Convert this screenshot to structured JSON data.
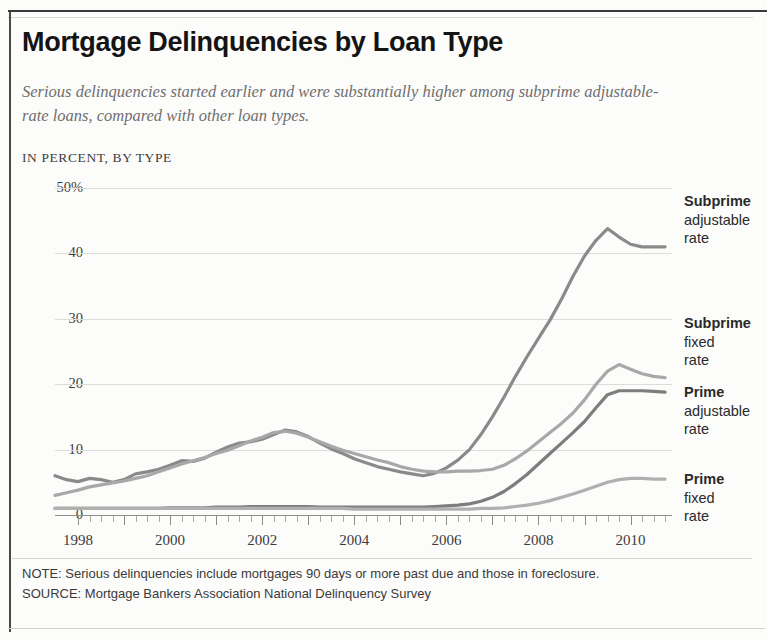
{
  "title": "Mortgage Delinquencies by Loan Type",
  "subtitle": "Serious delinquencies started earlier and were substantially higher among subprime adjustable-rate loans, compared with other loan types.",
  "kicker": "IN PERCENT, BY TYPE",
  "footer": {
    "note": "NOTE: Serious delinquencies include mortgages 90 days or more past due and those in foreclosure.",
    "source": "SOURCE: Mortgage Bankers Association National Delinquency Survey"
  },
  "legend": [
    {
      "name": "Subprime",
      "line2": "adjustable",
      "line3": "rate"
    },
    {
      "name": "Subprime",
      "line2": "fixed",
      "line3": "rate"
    },
    {
      "name": "Prime",
      "line2": "adjustable",
      "line3": "rate"
    },
    {
      "name": "Prime",
      "line2": "fixed",
      "line3": "rate"
    }
  ],
  "axis": {
    "y_ticks": [
      "50%",
      "40",
      "30",
      "20",
      "10",
      "0"
    ],
    "x_ticks": [
      "1998",
      "2000",
      "2002",
      "2004",
      "2006",
      "2008",
      "2010"
    ]
  },
  "colors": {
    "subprime_adjustable": "#8a8a8a",
    "subprime_fixed": "#a8a8a8",
    "prime_adjustable": "#7d7d7d",
    "prime_fixed": "#b0b0b0",
    "grid": "#dcdcda",
    "axis": "#8f8f8f"
  },
  "chart_data": {
    "type": "line",
    "title": "Mortgage Delinquencies by Loan Type",
    "subtitle": "Serious delinquencies started earlier and were substantially higher among subprime adjustable-rate loans, compared with other loan types.",
    "xlabel": "",
    "ylabel": "IN PERCENT, BY TYPE",
    "xlim": [
      1997.5,
      2010.9
    ],
    "ylim": [
      0,
      50
    ],
    "grid": true,
    "legend_position": "right",
    "x": [
      1997.5,
      1997.75,
      1998,
      1998.25,
      1998.5,
      1998.75,
      1999,
      1999.25,
      1999.5,
      1999.75,
      2000,
      2000.25,
      2000.5,
      2000.75,
      2001,
      2001.25,
      2001.5,
      2001.75,
      2002,
      2002.25,
      2002.5,
      2002.75,
      2003,
      2003.25,
      2003.5,
      2003.75,
      2004,
      2004.25,
      2004.5,
      2004.75,
      2005,
      2005.25,
      2005.5,
      2005.75,
      2006,
      2006.25,
      2006.5,
      2006.75,
      2007,
      2007.25,
      2007.5,
      2007.75,
      2008,
      2008.25,
      2008.5,
      2008.75,
      2009,
      2009.25,
      2009.5,
      2009.75,
      2010,
      2010.25,
      2010.5,
      2010.75
    ],
    "series": [
      {
        "name": "Subprime adjustable rate",
        "color": "#8a8a8a",
        "values": [
          6.0,
          5.4,
          5.1,
          5.6,
          5.4,
          5.0,
          5.4,
          6.3,
          6.6,
          7.0,
          7.6,
          8.3,
          8.2,
          8.7,
          9.6,
          10.4,
          11.0,
          11.2,
          11.6,
          12.3,
          13.0,
          12.7,
          12.0,
          11.0,
          10.1,
          9.4,
          8.6,
          8.0,
          7.4,
          7.0,
          6.6,
          6.3,
          6.0,
          6.4,
          7.2,
          8.4,
          10.0,
          12.3,
          15.0,
          18.0,
          21.2,
          24.2,
          27.0,
          29.8,
          33.0,
          36.5,
          39.6,
          42.0,
          43.8,
          42.5,
          41.4,
          41.0,
          41.0,
          41.0
        ]
      },
      {
        "name": "Subprime fixed rate",
        "color": "#a8a8a8",
        "values": [
          3.0,
          3.4,
          3.8,
          4.3,
          4.6,
          4.9,
          5.2,
          5.6,
          6.0,
          6.6,
          7.2,
          7.8,
          8.3,
          8.8,
          9.4,
          9.9,
          10.6,
          11.3,
          11.9,
          12.6,
          12.8,
          12.5,
          11.9,
          11.2,
          10.5,
          9.9,
          9.4,
          8.9,
          8.4,
          8.0,
          7.4,
          7.0,
          6.7,
          6.6,
          6.6,
          6.7,
          6.7,
          6.8,
          7.0,
          7.6,
          8.6,
          9.8,
          11.2,
          12.6,
          14.0,
          15.6,
          17.6,
          20.0,
          22.0,
          23.0,
          22.3,
          21.6,
          21.2,
          21.0
        ]
      },
      {
        "name": "Prime adjustable rate",
        "color": "#7d7d7d",
        "values": [
          1.0,
          1.0,
          1.0,
          1.0,
          1.0,
          1.0,
          1.0,
          1.0,
          1.0,
          1.0,
          1.1,
          1.1,
          1.1,
          1.1,
          1.2,
          1.2,
          1.2,
          1.3,
          1.3,
          1.3,
          1.3,
          1.3,
          1.3,
          1.2,
          1.2,
          1.2,
          1.2,
          1.2,
          1.2,
          1.2,
          1.2,
          1.2,
          1.2,
          1.3,
          1.4,
          1.5,
          1.7,
          2.1,
          2.7,
          3.6,
          4.8,
          6.2,
          7.8,
          9.4,
          11.0,
          12.6,
          14.3,
          16.4,
          18.4,
          19.0,
          19.0,
          19.0,
          18.9,
          18.8
        ]
      },
      {
        "name": "Prime fixed rate",
        "color": "#b0b0b0",
        "values": [
          1.0,
          1.0,
          1.0,
          1.0,
          1.0,
          1.0,
          1.0,
          1.0,
          1.0,
          1.0,
          1.0,
          1.0,
          1.0,
          1.0,
          1.0,
          1.0,
          1.0,
          1.0,
          1.0,
          1.0,
          1.0,
          1.0,
          1.0,
          1.0,
          1.0,
          1.0,
          0.9,
          0.9,
          0.9,
          0.9,
          0.9,
          0.9,
          0.9,
          0.9,
          0.9,
          0.9,
          0.9,
          1.0,
          1.0,
          1.1,
          1.3,
          1.5,
          1.8,
          2.2,
          2.7,
          3.2,
          3.8,
          4.4,
          5.0,
          5.4,
          5.6,
          5.6,
          5.5,
          5.5
        ]
      }
    ]
  }
}
